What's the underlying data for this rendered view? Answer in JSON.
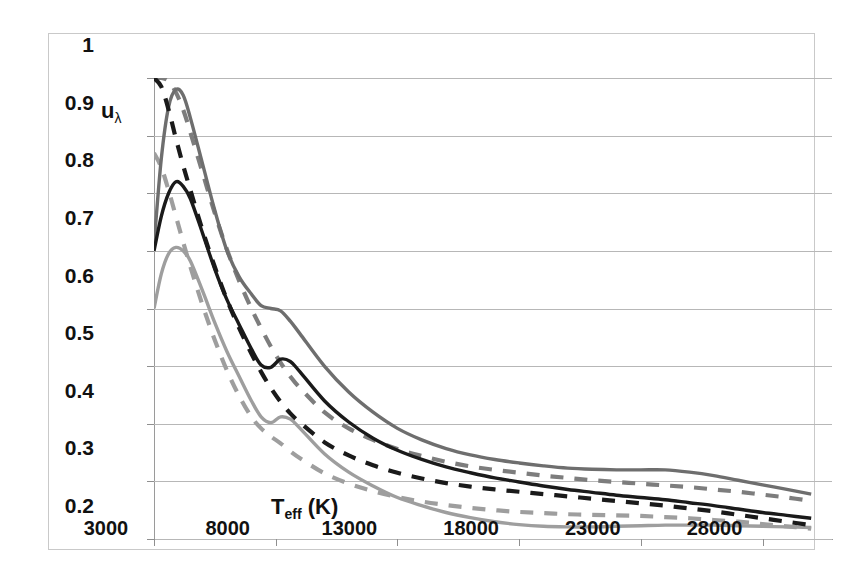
{
  "figure": {
    "ylabel": "u",
    "ylabel_sub": "λ",
    "xlabel": "T",
    "xlabel_sub": "eff",
    "xlabel_unit": " (K)"
  },
  "axes": {
    "y_ticks": [
      "1",
      "0.9",
      "0.8",
      "0.7",
      "0.6",
      "0.5",
      "0.4",
      "0.3",
      "0.2"
    ],
    "x_ticks": [
      "3000",
      "8000",
      "13000",
      "18000",
      "23000",
      "28000"
    ]
  },
  "colors": {
    "black": "#1a1a1a",
    "gray_dark": "#6e6e6e",
    "gray_light": "#9e9e9e",
    "grid": "#b7b7b7",
    "frame": "#c9c9c9",
    "background": "#ffffff"
  },
  "chart_data": {
    "type": "line",
    "title": "",
    "xlabel": "T_eff (K)",
    "ylabel": "u_lambda",
    "xlim": [
      3000,
      30000
    ],
    "ylim": [
      0.2,
      1.0
    ],
    "grid": true,
    "legend": "none",
    "x": [
      3000,
      3300,
      3600,
      3900,
      4200,
      4500,
      5000,
      5500,
      6000,
      6500,
      7000,
      7400,
      7800,
      8200,
      8600,
      9000,
      10000,
      11000,
      12000,
      13000,
      14000,
      15000,
      16000,
      17000,
      18000,
      19000,
      20000,
      21000,
      22000,
      23000,
      24000,
      25000,
      26000,
      27000,
      28000,
      29000,
      30000
    ],
    "series": [
      {
        "name": "upper-solid-gray",
        "style": "solid",
        "color": "#6e6e6e",
        "values": [
          0.71,
          0.86,
          0.95,
          0.98,
          0.97,
          0.93,
          0.85,
          0.77,
          0.7,
          0.655,
          0.625,
          0.605,
          0.6,
          0.596,
          0.578,
          0.556,
          0.5,
          0.455,
          0.42,
          0.392,
          0.372,
          0.357,
          0.346,
          0.338,
          0.332,
          0.327,
          0.323,
          0.321,
          0.32,
          0.32,
          0.32,
          0.316,
          0.31,
          0.302,
          0.294,
          0.286,
          0.278
        ]
      },
      {
        "name": "middle-solid-black",
        "style": "solid",
        "color": "#1a1a1a",
        "values": [
          0.7,
          0.76,
          0.8,
          0.82,
          0.812,
          0.79,
          0.73,
          0.668,
          0.615,
          0.572,
          0.53,
          0.502,
          0.498,
          0.512,
          0.508,
          0.49,
          0.44,
          0.403,
          0.375,
          0.354,
          0.338,
          0.325,
          0.315,
          0.306,
          0.299,
          0.292,
          0.286,
          0.281,
          0.276,
          0.272,
          0.268,
          0.263,
          0.258,
          0.252,
          0.246,
          0.241,
          0.236
        ]
      },
      {
        "name": "lower-solid-lightgray",
        "style": "solid",
        "color": "#9e9e9e",
        "values": [
          0.6,
          0.66,
          0.695,
          0.706,
          0.7,
          0.682,
          0.63,
          0.575,
          0.525,
          0.482,
          0.44,
          0.412,
          0.402,
          0.412,
          0.408,
          0.392,
          0.348,
          0.316,
          0.292,
          0.272,
          0.258,
          0.246,
          0.237,
          0.23,
          0.225,
          0.222,
          0.221,
          0.221,
          0.222,
          0.223,
          0.224,
          0.224,
          0.224,
          0.223,
          0.222,
          0.221,
          0.22
        ]
      },
      {
        "name": "upper-dashed-gray",
        "style": "dashed",
        "color": "#7d7d7d",
        "values": [
          1.0,
          1.0,
          0.995,
          0.975,
          0.945,
          0.905,
          0.835,
          0.765,
          0.702,
          0.648,
          0.6,
          0.566,
          0.534,
          0.506,
          0.482,
          0.462,
          0.42,
          0.392,
          0.372,
          0.356,
          0.344,
          0.334,
          0.326,
          0.32,
          0.315,
          0.31,
          0.306,
          0.302,
          0.299,
          0.296,
          0.293,
          0.29,
          0.286,
          0.282,
          0.277,
          0.272,
          0.266
        ]
      },
      {
        "name": "middle-dashed-black",
        "style": "dashed",
        "color": "#1a1a1a",
        "values": [
          1.0,
          0.985,
          0.945,
          0.895,
          0.848,
          0.805,
          0.735,
          0.672,
          0.615,
          0.566,
          0.522,
          0.49,
          0.462,
          0.438,
          0.418,
          0.402,
          0.368,
          0.345,
          0.328,
          0.315,
          0.305,
          0.297,
          0.291,
          0.286,
          0.282,
          0.278,
          0.274,
          0.27,
          0.266,
          0.262,
          0.258,
          0.253,
          0.248,
          0.242,
          0.236,
          0.23,
          0.224
        ]
      },
      {
        "name": "lower-dashed-lightgray",
        "style": "dashed",
        "color": "#9e9e9e",
        "values": [
          0.87,
          0.845,
          0.805,
          0.76,
          0.715,
          0.672,
          0.605,
          0.545,
          0.492,
          0.448,
          0.412,
          0.392,
          0.378,
          0.366,
          0.352,
          0.34,
          0.314,
          0.296,
          0.283,
          0.273,
          0.265,
          0.259,
          0.254,
          0.25,
          0.247,
          0.245,
          0.243,
          0.242,
          0.241,
          0.24,
          0.238,
          0.236,
          0.233,
          0.23,
          0.226,
          0.222,
          0.218
        ]
      }
    ]
  }
}
